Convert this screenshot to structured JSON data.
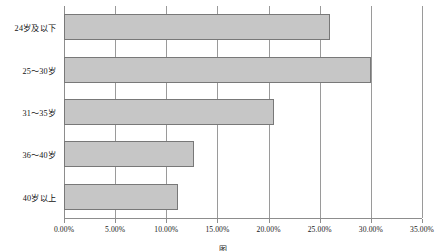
{
  "chart_data": {
    "type": "bar",
    "orientation": "horizontal",
    "title": "",
    "xlabel": "",
    "ylabel": "",
    "categories": [
      "24岁及以下",
      "25～30岁",
      "31～35岁",
      "36～40岁",
      "40岁以上"
    ],
    "values": [
      26.0,
      30.0,
      20.5,
      12.7,
      11.1
    ],
    "value_labels": [
      "26.00%",
      "30.00%",
      "20.50%",
      "12.70%",
      "11.10%"
    ],
    "xlim": [
      0,
      35
    ],
    "xticks": [
      0,
      5,
      10,
      15,
      20,
      25,
      30,
      35
    ],
    "xtick_labels": [
      "0.00%",
      "5.00%",
      "10.00%",
      "15.00%",
      "20.00%",
      "25.00%",
      "30.00%",
      "35.00%"
    ],
    "grid": true,
    "grid_axis": "x",
    "legend": null,
    "bar_color": "#c6c6c6",
    "bar_border_color": "#787878",
    "axis_color": "#8d8d8d",
    "background": "#ffffff"
  },
  "caption": {
    "text": "图"
  }
}
